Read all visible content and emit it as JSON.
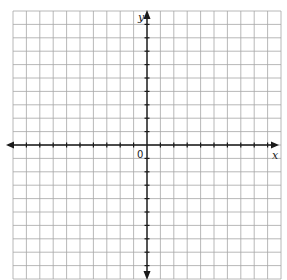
{
  "diagram": {
    "type": "coordinate-plane",
    "grid": {
      "columns": 20,
      "rows": 20,
      "left": 13,
      "top": 11,
      "cell": 13.4,
      "line_color": "#a6a6a6"
    },
    "axes": {
      "color": "#1a1a1a",
      "x_label": "x",
      "y_label": "y",
      "origin_label": "0",
      "x_axis_row": 10,
      "y_axis_col": 10,
      "tick_marks": true,
      "arrows": "both-ends"
    }
  }
}
